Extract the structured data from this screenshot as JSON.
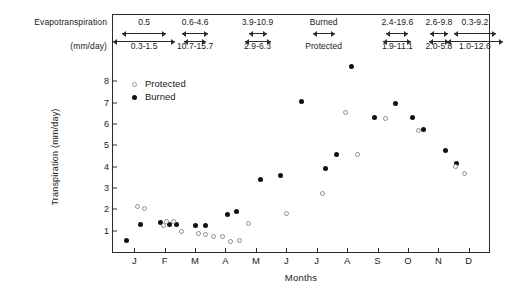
{
  "header": {
    "row_label_top": "Evapotranspiration",
    "row_label_bottom": "(mm/day)",
    "columns": [
      {
        "top": "0.5",
        "bottom": "0.3-1.5",
        "center_pct": 8.5,
        "arrow_top_w": 44,
        "arrow_bot_w": 62
      },
      {
        "top": "0.6-4.6",
        "bottom": "10.7-15.7",
        "center_pct": 22.0,
        "arrow_top_w": 26,
        "arrow_bot_w": 22
      },
      {
        "top": "3.9-10.9",
        "bottom": "2.9-6.3",
        "center_pct": 38.5,
        "arrow_top_w": 18,
        "arrow_bot_w": 26
      },
      {
        "top": "Burned",
        "bottom": "Protected",
        "center_pct": 56.0,
        "arrow_top_w": 22,
        "arrow_bot_w": 0
      },
      {
        "top": "2.4-19.6",
        "bottom": "1.9-11.1",
        "center_pct": 75.5,
        "arrow_top_w": 22,
        "arrow_bot_w": 28
      },
      {
        "top": "2.6-9.8",
        "bottom": "2.0-5.8",
        "center_pct": 86.5,
        "arrow_top_w": 18,
        "arrow_bot_w": 20
      },
      {
        "top": "0.3-9.2",
        "bottom": "1.0-12.6",
        "center_pct": 96.0,
        "arrow_top_w": 42,
        "arrow_bot_w": 56
      }
    ]
  },
  "legend": {
    "items": [
      {
        "label": "Protected",
        "style": "protected"
      },
      {
        "label": "Burned",
        "style": "burned"
      }
    ]
  },
  "chart_data": {
    "type": "scatter",
    "title": "",
    "xlabel": "Months",
    "ylabel": "Transpiration (mm/day)",
    "categories": [
      "J",
      "F",
      "M",
      "A",
      "M",
      "J",
      "J",
      "A",
      "S",
      "O",
      "N",
      "D"
    ],
    "ylim": [
      0,
      9
    ],
    "yticks": [
      1,
      2,
      3,
      4,
      5,
      6,
      7,
      8
    ],
    "xlim": [
      0.3,
      12.7
    ],
    "grid": false,
    "legend_position": "top-left",
    "series": [
      {
        "name": "Burned",
        "marker": "filled-circle",
        "color": "#111111",
        "points": [
          {
            "x": 0.75,
            "y": 0.55
          },
          {
            "x": 1.2,
            "y": 1.3
          },
          {
            "x": 1.85,
            "y": 1.4
          },
          {
            "x": 2.15,
            "y": 1.3
          },
          {
            "x": 2.4,
            "y": 1.3
          },
          {
            "x": 3.0,
            "y": 1.25
          },
          {
            "x": 3.35,
            "y": 1.25
          },
          {
            "x": 4.05,
            "y": 1.75
          },
          {
            "x": 4.35,
            "y": 1.9
          },
          {
            "x": 5.15,
            "y": 3.4
          },
          {
            "x": 5.8,
            "y": 3.6
          },
          {
            "x": 6.5,
            "y": 7.05
          },
          {
            "x": 7.3,
            "y": 3.9
          },
          {
            "x": 7.65,
            "y": 4.55
          },
          {
            "x": 8.15,
            "y": 8.7
          },
          {
            "x": 8.9,
            "y": 6.3
          },
          {
            "x": 9.6,
            "y": 6.95
          },
          {
            "x": 10.15,
            "y": 6.3
          },
          {
            "x": 10.5,
            "y": 5.75
          },
          {
            "x": 11.25,
            "y": 4.75
          },
          {
            "x": 11.6,
            "y": 4.15
          }
        ]
      },
      {
        "name": "Protected",
        "marker": "open-circle",
        "color": "#8d8d8d",
        "points": [
          {
            "x": 1.1,
            "y": 2.15
          },
          {
            "x": 1.35,
            "y": 2.05
          },
          {
            "x": 1.95,
            "y": 1.25
          },
          {
            "x": 2.05,
            "y": 1.45
          },
          {
            "x": 2.3,
            "y": 1.45
          },
          {
            "x": 2.55,
            "y": 0.95
          },
          {
            "x": 3.1,
            "y": 0.85
          },
          {
            "x": 3.35,
            "y": 0.8
          },
          {
            "x": 3.6,
            "y": 0.75
          },
          {
            "x": 3.9,
            "y": 0.75
          },
          {
            "x": 4.15,
            "y": 0.5
          },
          {
            "x": 4.45,
            "y": 0.55
          },
          {
            "x": 4.75,
            "y": 1.35
          },
          {
            "x": 6.0,
            "y": 1.8
          },
          {
            "x": 7.2,
            "y": 2.75
          },
          {
            "x": 7.95,
            "y": 6.55
          },
          {
            "x": 8.35,
            "y": 4.55
          },
          {
            "x": 9.25,
            "y": 6.25
          },
          {
            "x": 10.35,
            "y": 5.7
          },
          {
            "x": 11.55,
            "y": 4.0
          },
          {
            "x": 11.85,
            "y": 3.7
          }
        ]
      }
    ]
  }
}
